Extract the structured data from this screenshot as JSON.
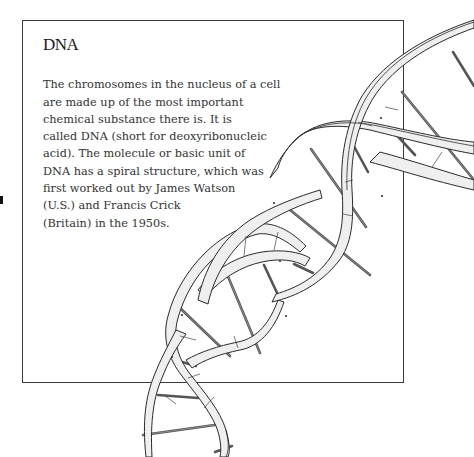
{
  "page": {
    "heading": "DNA",
    "paragraph_lines": [
      "The chromosomes in the nucleus of a cell",
      "are made up of the most important",
      "chemical substance there is. It is",
      "called DNA (short for deoxyribonucleic",
      "acid). The molecule or basic unit of",
      "DNA has a spiral structure, which was",
      "first worked out by James Watson",
      "(U.S.) and Francis Crick",
      "(Britain) in the 1950s."
    ]
  },
  "illustration": {
    "subject": "dna-double-helix",
    "colors": {
      "ribbon_fill": "#efefef",
      "outline": "#2a2a2a",
      "rungs": "#555555",
      "box_border": "#3a3a3a",
      "text": "#333333"
    }
  }
}
